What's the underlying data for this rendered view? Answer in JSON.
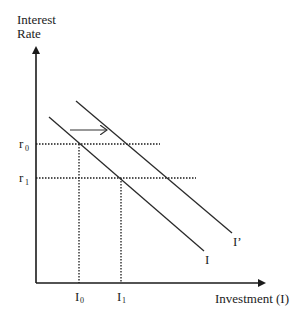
{
  "diagram": {
    "type": "economics-investment-demand-shift",
    "y_axis": {
      "label_line1": "Interest",
      "label_line2": "Rate"
    },
    "x_axis": {
      "label": "Investment (I)"
    },
    "rates": [
      {
        "symbol": "r",
        "sub": "0"
      },
      {
        "symbol": "r",
        "sub": "1"
      }
    ],
    "investment_levels": [
      {
        "symbol": "I",
        "sub": "0"
      },
      {
        "symbol": "I",
        "sub": "1"
      }
    ],
    "curves": [
      {
        "name": "I",
        "label": "I"
      },
      {
        "name": "I-prime",
        "label": "I’"
      }
    ],
    "shift_arrow": {
      "direction": "right"
    },
    "colors": {
      "line": "#1a1a1a",
      "background": "#ffffff"
    }
  }
}
